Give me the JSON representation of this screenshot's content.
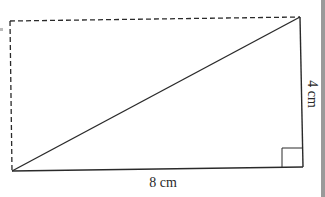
{
  "diagram": {
    "labels": {
      "base": "8 cm",
      "height": "4 cm"
    },
    "shapes": {
      "rectangle": {
        "style": "dashed",
        "edges": [
          "top",
          "left"
        ]
      },
      "triangle": {
        "style": "solid",
        "edges": [
          "base",
          "right",
          "hypotenuse"
        ],
        "right_angle_at": "bottom-right"
      }
    },
    "colors": {
      "stroke": "#2a2a2a",
      "background": "#ffffff",
      "page_edge": "#9a9a9a"
    }
  }
}
